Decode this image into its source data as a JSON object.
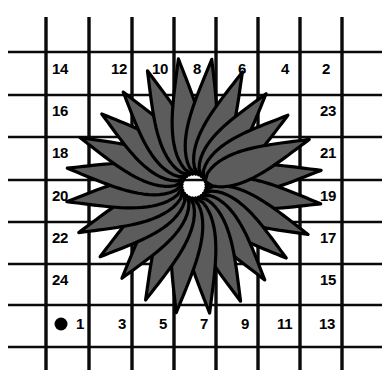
{
  "figure": {
    "name": "starburst-grid-diagram",
    "background_color": "#ffffff",
    "width": 386,
    "height": 383
  },
  "grid": {
    "line_color": "#0a0a0a",
    "vertical_x": [
      46,
      89,
      132,
      174,
      216,
      258,
      300,
      342
    ],
    "horizontal_y": [
      52,
      95,
      137,
      180,
      222,
      264,
      305,
      347
    ],
    "vertical_span": [
      17,
      370
    ],
    "horizontal_span": [
      8,
      382
    ],
    "thin_width": 2.6,
    "thick_width": 3.4
  },
  "origin_marker": {
    "label": "origin-dot",
    "cx": 61,
    "cy": 324,
    "r": 6.5,
    "color": "#000000"
  },
  "starburst": {
    "center_x": 194,
    "center_y": 186,
    "petal_count": 24,
    "fill_color": "#5c5c5c",
    "outline_color": "#000000",
    "inner_radius": 12,
    "outer_radius": 126,
    "petal_half_width": 15,
    "rotation_offset_deg": -7
  },
  "labels": {
    "top_row": [
      {
        "text": "14",
        "x": 52,
        "y": 61
      },
      {
        "text": "12",
        "x": 111,
        "y": 61
      },
      {
        "text": "10",
        "x": 152,
        "y": 61
      },
      {
        "text": "8",
        "x": 193,
        "y": 61
      },
      {
        "text": "6",
        "x": 238,
        "y": 61
      },
      {
        "text": "4",
        "x": 281,
        "y": 61
      },
      {
        "text": "2",
        "x": 322,
        "y": 61
      }
    ],
    "left_column": [
      {
        "text": "16",
        "x": 52,
        "y": 103
      },
      {
        "text": "18",
        "x": 52,
        "y": 145
      },
      {
        "text": "20",
        "x": 52,
        "y": 188
      },
      {
        "text": "22",
        "x": 52,
        "y": 230
      },
      {
        "text": "24",
        "x": 52,
        "y": 272
      }
    ],
    "right_column": [
      {
        "text": "23",
        "x": 320,
        "y": 103
      },
      {
        "text": "21",
        "x": 320,
        "y": 145
      },
      {
        "text": "19",
        "x": 320,
        "y": 188
      },
      {
        "text": "17",
        "x": 320,
        "y": 230
      },
      {
        "text": "15",
        "x": 320,
        "y": 272
      }
    ],
    "bottom_row": [
      {
        "text": "1",
        "x": 76,
        "y": 316
      },
      {
        "text": "3",
        "x": 118,
        "y": 316
      },
      {
        "text": "5",
        "x": 159,
        "y": 316
      },
      {
        "text": "7",
        "x": 200,
        "y": 316
      },
      {
        "text": "9",
        "x": 241,
        "y": 316
      },
      {
        "text": "11",
        "x": 277,
        "y": 316
      },
      {
        "text": "13",
        "x": 319,
        "y": 316
      }
    ]
  }
}
